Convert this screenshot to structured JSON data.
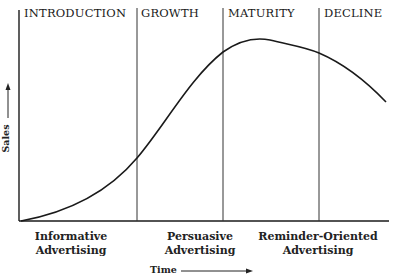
{
  "stages": [
    {
      "label": "INTRODUCTION"
    },
    {
      "label": "GROWTH"
    },
    {
      "label": "MATURITY"
    },
    {
      "label": "DECLINE"
    }
  ],
  "advertising": [
    {
      "line1": "Informative",
      "line2": "Advertising"
    },
    {
      "line1": "Persuasive",
      "line2": "Advertising"
    },
    {
      "line1": "Reminder-Oriented",
      "line2": "Advertising"
    }
  ],
  "axes": {
    "y_label": "Sales",
    "x_label": "Time"
  },
  "colors": {
    "line": "#1a1a1a",
    "background": "#ffffff"
  }
}
